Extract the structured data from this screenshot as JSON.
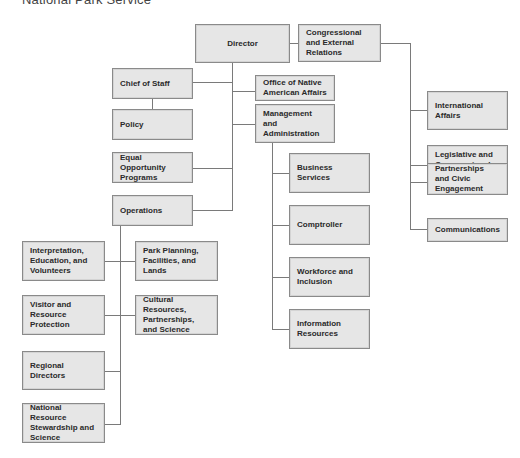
{
  "title": "National Park Service",
  "colors": {
    "box_fill": "#e6e6e6",
    "box_border": "#8a8a8a",
    "line": "#7a7a7a",
    "text": "#2a2a2a"
  },
  "nodes": {
    "director": "Director",
    "congressional": "Congressional and External Relations",
    "chief_of_staff": "Chief of Staff",
    "native_american": "Office of Native American Affairs",
    "policy": "Policy",
    "management": "Management and Administration",
    "equal_opportunity": "Equal Opportunity Programs",
    "operations": "Operations",
    "business_services": "Business Services",
    "comptroller": "Comptroller",
    "workforce": "Workforce and Inclusion",
    "information_resources": "Information Resources",
    "international": "International Affairs",
    "legislative": "Legislative and Congressional Affairs",
    "partnerships": "Partnerships and Civic Engagement",
    "communications": "Communications",
    "interpretation": "Interpretation, Education, and Volunteers",
    "park_planning": "Park Planning, Facilities, and Lands",
    "visitor": "Visitor and Resource Protection",
    "cultural": "Cultural Resources, Partnerships, and Science",
    "regional": "Regional Directors",
    "natural_resource": "National Resource Stewardship and Science"
  }
}
